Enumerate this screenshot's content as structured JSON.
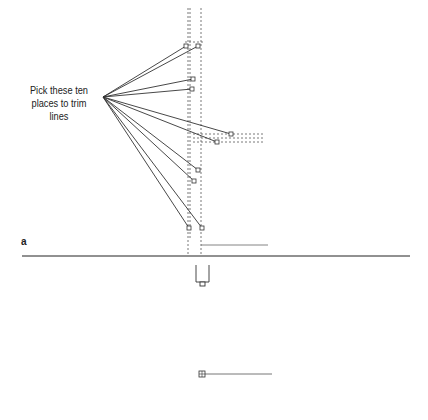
{
  "callout": {
    "line1": "Pick these ten",
    "line2": "places to trim lines",
    "anchor": [
      103,
      97
    ]
  },
  "figure_label": "a",
  "colors": {
    "line": "#333333",
    "dashed": "#555555",
    "rule": "#222222",
    "background": "#ffffff"
  },
  "trim_points": [
    {
      "x": 186,
      "y": 46
    },
    {
      "x": 198,
      "y": 46
    },
    {
      "x": 193,
      "y": 79
    },
    {
      "x": 192,
      "y": 89
    },
    {
      "x": 231,
      "y": 134
    },
    {
      "x": 217,
      "y": 142
    },
    {
      "x": 198,
      "y": 170
    },
    {
      "x": 194,
      "y": 181
    },
    {
      "x": 189,
      "y": 228
    },
    {
      "x": 202,
      "y": 228
    }
  ],
  "trim_count": 10
}
